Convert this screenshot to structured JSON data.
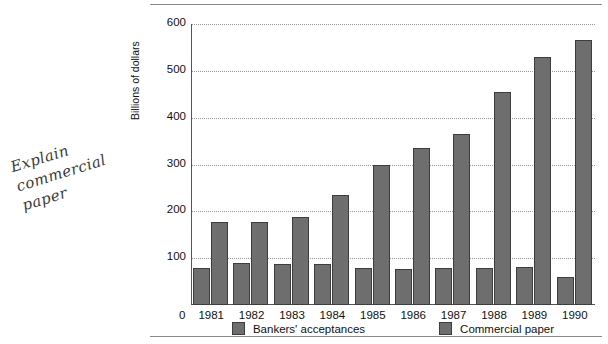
{
  "annotation": {
    "handwritten_note": "Explain\ncommercial\npaper"
  },
  "chart_data": {
    "type": "bar",
    "title": "",
    "xlabel": "",
    "ylabel": "Billions of dollars",
    "categories": [
      "1981",
      "1982",
      "1983",
      "1984",
      "1985",
      "1986",
      "1987",
      "1988",
      "1989",
      "1990"
    ],
    "series": [
      {
        "name": "Bankers' acceptances",
        "color": "#6e6e6e",
        "values": [
          80,
          90,
          88,
          88,
          80,
          77,
          80,
          78,
          82,
          60
        ]
      },
      {
        "name": "Commercial paper",
        "color": "#6e6e6e",
        "values": [
          178,
          178,
          188,
          235,
          300,
          335,
          365,
          455,
          530,
          565
        ]
      }
    ],
    "ylim": [
      0,
      600
    ],
    "yticks": [
      100,
      200,
      300,
      400,
      500,
      600
    ],
    "y_zero_label": "0",
    "grid": true,
    "legend_position": "bottom"
  }
}
